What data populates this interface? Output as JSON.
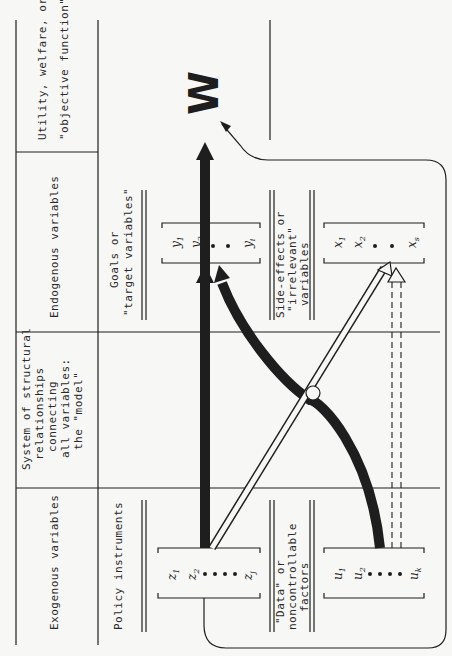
{
  "columns": {
    "exogenous": {
      "header": "Exogenous variables"
    },
    "model": {
      "header_lines": [
        "System of structural",
        "relationships",
        "connecting",
        "all variables:",
        "the \"model\""
      ]
    },
    "endogenous": {
      "header": "Endogenous variables"
    },
    "utility": {
      "header_lines": [
        "Utility, welfare, or",
        "\"objective function\""
      ]
    }
  },
  "groups": {
    "policy": {
      "label": "Policy instruments",
      "vars": [
        "z",
        "z",
        "z"
      ],
      "subs": [
        "1",
        "2",
        "j"
      ]
    },
    "data": {
      "label_lines": [
        "\"Data\" or",
        "noncontrollable",
        "factors"
      ],
      "vars": [
        "u",
        "u",
        "u"
      ],
      "subs": [
        "1",
        "2",
        "k"
      ]
    },
    "goals": {
      "label_lines": [
        "Goals or",
        "\"target variables\""
      ],
      "vars": [
        "y",
        "y",
        "y"
      ],
      "subs": [
        "1",
        "2",
        "i"
      ]
    },
    "side": {
      "label_lines": [
        "Side-effects or",
        "\"irrelevant\"",
        "variables"
      ],
      "vars": [
        "x",
        "x",
        "x"
      ],
      "subs": [
        "1",
        "2",
        "s"
      ]
    }
  },
  "welfare_symbol": "W",
  "colors": {
    "ink": "#1e1e1e",
    "paper": "#f7f7f5"
  }
}
